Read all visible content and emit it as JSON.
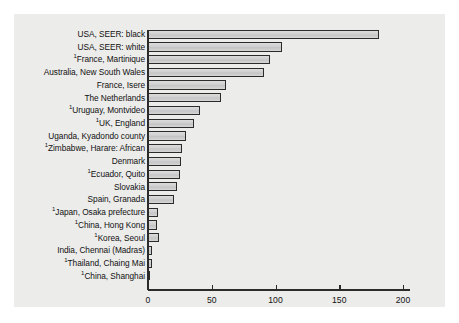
{
  "figure": {
    "background_color": "#ffffff",
    "panel_color": "#ececeb",
    "bar_fill_color": "#d2d2d2",
    "bar_edge_color": "#2b2b2b",
    "axis_color": "#2b2b2b",
    "text_color": "#111111"
  },
  "chart_data": {
    "type": "bar",
    "orientation": "horizontal",
    "title": "",
    "xlabel": "",
    "ylabel": "",
    "xlim": [
      0,
      200
    ],
    "ylim": null,
    "grid": false,
    "legend": null,
    "xticks": [
      0,
      50,
      100,
      150,
      200
    ],
    "xtick_labels": [
      "0",
      "50",
      "100",
      "150",
      "200"
    ],
    "footnote_marker": "1",
    "categories": [
      "USA, SEER: black",
      "USA, SEER: white",
      "France, Martinique",
      "Australia, New South Wales",
      "France, Isere",
      "The Netherlands",
      "Uruguay, Montvideo",
      "UK, England",
      "Uganda, Kyadondo county",
      "Zimbabwe, Harare: African",
      "Denmark",
      "Ecuador, Quito",
      "Slovakia",
      "Spain, Granada",
      "Japan, Osaka prefecture",
      "China, Hong Kong",
      "Korea, Seoul",
      "India, Chennai (Madras)",
      "Thailand, Chaing Mai",
      "China, Shanghai"
    ],
    "category_prefix_marker": [
      false,
      false,
      true,
      false,
      false,
      false,
      true,
      true,
      false,
      true,
      false,
      true,
      false,
      false,
      true,
      true,
      true,
      false,
      true,
      true
    ],
    "values": [
      181,
      105,
      96,
      91,
      61,
      57,
      41,
      36,
      30,
      27,
      26,
      25,
      23,
      20,
      8,
      7,
      9,
      3.5,
      3,
      1.5
    ]
  }
}
